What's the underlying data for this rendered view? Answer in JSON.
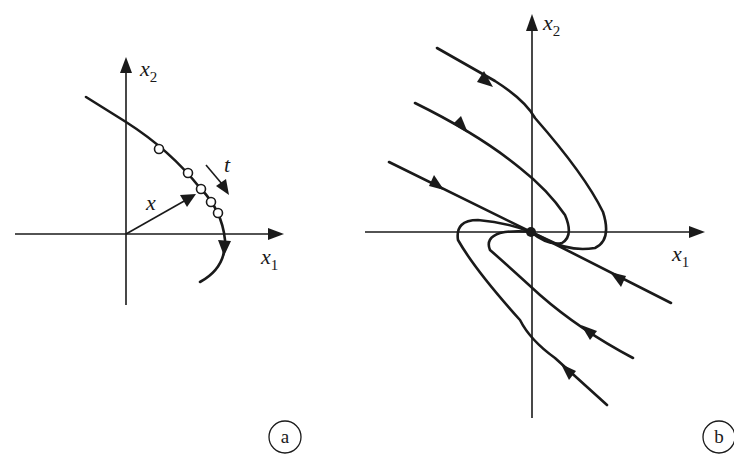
{
  "figure": {
    "panels": [
      {
        "id": "a",
        "label": "a",
        "axes": {
          "x_label": "x",
          "x_sub": "1",
          "y_label": "x",
          "y_sub": "2"
        },
        "vector_label": "x",
        "time_label": "t",
        "description": "Single trajectory x(t) with sampled states (open circles) moving along the curve; arrow t shows direction of increasing time"
      },
      {
        "id": "b",
        "label": "b",
        "axes": {
          "x_label": "x",
          "x_sub": "1",
          "y_label": "x",
          "y_sub": "2"
        },
        "description": "Phase portrait: trajectories converge to the equilibrium point at the origin (stable node)"
      }
    ]
  },
  "colors": {
    "ink": "#1a1a1a",
    "background": "#ffffff"
  }
}
